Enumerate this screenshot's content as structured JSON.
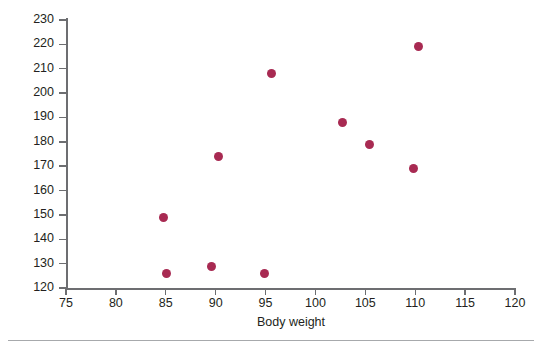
{
  "chart_data": {
    "type": "scatter",
    "title": "",
    "xlabel": "Body weight",
    "ylabel": "Strength",
    "xlim": [
      75,
      120
    ],
    "ylim": [
      120,
      230
    ],
    "xticks": [
      75,
      80,
      85,
      90,
      95,
      100,
      105,
      110,
      115,
      120
    ],
    "yticks": [
      120,
      130,
      140,
      150,
      160,
      170,
      180,
      190,
      200,
      210,
      220,
      230
    ],
    "grid": false,
    "legend": null,
    "marker_color": "#a82a52",
    "axis_color": "#6d6e71",
    "points": [
      {
        "x": 84.8,
        "y": 149
      },
      {
        "x": 85.1,
        "y": 126
      },
      {
        "x": 89.6,
        "y": 129
      },
      {
        "x": 90.3,
        "y": 174
      },
      {
        "x": 94.9,
        "y": 126
      },
      {
        "x": 95.6,
        "y": 208
      },
      {
        "x": 102.7,
        "y": 188
      },
      {
        "x": 105.4,
        "y": 179
      },
      {
        "x": 109.8,
        "y": 169
      },
      {
        "x": 110.3,
        "y": 219
      }
    ]
  }
}
